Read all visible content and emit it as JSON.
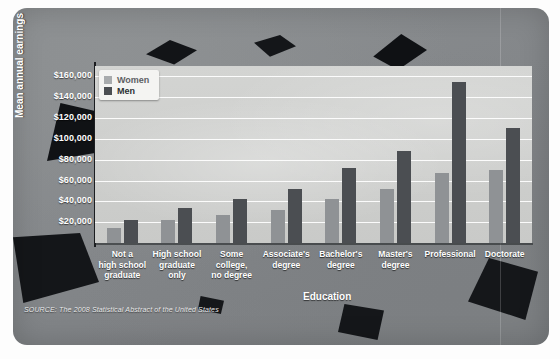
{
  "chart_data": {
    "type": "bar",
    "title": "",
    "xlabel": "Education",
    "ylabel": "Mean annual earnings",
    "ylim": [
      0,
      170000
    ],
    "grid": true,
    "legend_position": "top-left",
    "categories": [
      "Not a\nhigh school\ngraduate",
      "High school\ngraduate\nonly",
      "Some\ncollege,\nno degree",
      "Associate's\ndegree",
      "Bachelor's\ndegree",
      "Master's\ndegree",
      "Professional",
      "Doctorate"
    ],
    "ytick_labels": [
      "$160,000",
      "$140,000",
      "$120,000",
      "$100,000",
      "$80,000",
      "$60,000",
      "$40,000",
      "$20,000"
    ],
    "ytick_values": [
      160000,
      140000,
      120000,
      100000,
      80000,
      60000,
      40000,
      20000
    ],
    "series": [
      {
        "name": "Women",
        "color": "#8f9295",
        "values": [
          14000,
          22000,
          27000,
          32000,
          42000,
          52000,
          67000,
          70000
        ]
      },
      {
        "name": "Men",
        "color": "#4b4e52",
        "values": [
          22000,
          34000,
          42000,
          52000,
          72000,
          88000,
          155000,
          110000
        ]
      }
    ],
    "source": "SOURCE: The 2008 Statistical Abstract of the United States"
  },
  "legend": {
    "items": [
      {
        "label": "Women",
        "color": "#8f9295"
      },
      {
        "label": "Men",
        "color": "#4b4e52"
      }
    ]
  },
  "axis": {
    "y_title": "Mean annual earnings",
    "x_title": "Education"
  },
  "footer": {
    "source": "SOURCE: The 2008 Statistical Abstract of the United States"
  },
  "colors": {
    "women_bar": "#8f9295",
    "men_bar": "#4b4e52",
    "panel_bg": "#85888b",
    "plot_bg": "#cfd0ce",
    "gridline": "#ffffff",
    "text": "#ffffff"
  }
}
